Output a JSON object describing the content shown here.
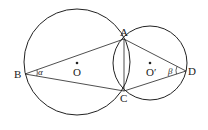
{
  "diagram": {
    "type": "two intersecting circles",
    "circles": [
      {
        "name": "O",
        "center": [
          77,
          62
        ],
        "radius": 53
      },
      {
        "name": "O'",
        "center": [
          150,
          63
        ],
        "radius": 37
      }
    ],
    "points": {
      "A": {
        "label": "A",
        "xy": [
          124,
          39
        ]
      },
      "B": {
        "label": "B",
        "xy": [
          25,
          74
        ]
      },
      "C": {
        "label": "C",
        "xy": [
          124,
          91
        ]
      },
      "D": {
        "label": "D",
        "xy": [
          186,
          71
        ]
      },
      "O": {
        "label": "O",
        "xy": [
          77,
          62
        ]
      },
      "O2": {
        "label": "O′",
        "xy": [
          150,
          63
        ]
      }
    },
    "segments": [
      "BA",
      "BC",
      "AC",
      "AD",
      "CD"
    ],
    "angles": {
      "alpha": {
        "label": "α",
        "at": "B"
      },
      "beta": {
        "label": "β",
        "at": "D"
      }
    },
    "colors": {
      "stroke": "#222222",
      "background": "#ffffff"
    }
  }
}
